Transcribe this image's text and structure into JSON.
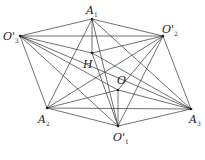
{
  "diagram": {
    "points": {
      "A1": {
        "x": 92,
        "y": 19,
        "label": "A",
        "sub": "1",
        "lx": 86,
        "ly": 14
      },
      "O3p": {
        "x": 20,
        "y": 36,
        "label": "O'",
        "sub": "3",
        "lx": 3,
        "ly": 40
      },
      "O2p": {
        "x": 163,
        "y": 36,
        "label": "O'",
        "sub": "2",
        "lx": 162,
        "ly": 33
      },
      "H": {
        "x": 92,
        "y": 53,
        "label": "H",
        "sub": "",
        "lx": 83,
        "ly": 68
      },
      "O": {
        "x": 118,
        "y": 90,
        "label": "O",
        "sub": "",
        "lx": 117,
        "ly": 84
      },
      "A2": {
        "x": 47,
        "y": 108,
        "label": "A",
        "sub": "2",
        "lx": 38,
        "ly": 123
      },
      "A3": {
        "x": 191,
        "y": 109,
        "label": "A",
        "sub": "3",
        "lx": 189,
        "ly": 123
      },
      "O1p": {
        "x": 118,
        "y": 126,
        "label": "O'",
        "sub": "1",
        "lx": 113,
        "ly": 141
      }
    },
    "edges": [
      [
        "A1",
        "O3p"
      ],
      [
        "A1",
        "O2p"
      ],
      [
        "A1",
        "A2"
      ],
      [
        "A1",
        "A3"
      ],
      [
        "A1",
        "H"
      ],
      [
        "A1",
        "O1p"
      ],
      [
        "O3p",
        "O2p"
      ],
      [
        "O3p",
        "A2"
      ],
      [
        "O3p",
        "A3"
      ],
      [
        "O3p",
        "O1p"
      ],
      [
        "O3p",
        "O"
      ],
      [
        "O3p",
        "H"
      ],
      [
        "O2p",
        "A3"
      ],
      [
        "O2p",
        "A2"
      ],
      [
        "O2p",
        "O1p"
      ],
      [
        "O2p",
        "O"
      ],
      [
        "O2p",
        "H"
      ],
      [
        "A2",
        "A3"
      ],
      [
        "A2",
        "O1p"
      ],
      [
        "A2",
        "O"
      ],
      [
        "A3",
        "O1p"
      ],
      [
        "A3",
        "O"
      ],
      [
        "A3",
        "H"
      ],
      [
        "O",
        "O1p"
      ],
      [
        "H",
        "O1p"
      ]
    ]
  }
}
